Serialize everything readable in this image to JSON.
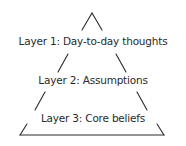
{
  "diagram": {
    "type": "pyramid",
    "layers": [
      {
        "label": "Layer 1: Day-to-day thoughts"
      },
      {
        "label": "Layer 2: Assumptions"
      },
      {
        "label": "Layer 3: Core beliefs"
      }
    ],
    "stroke_color": "#2a2a2a",
    "background": "#ffffff"
  }
}
